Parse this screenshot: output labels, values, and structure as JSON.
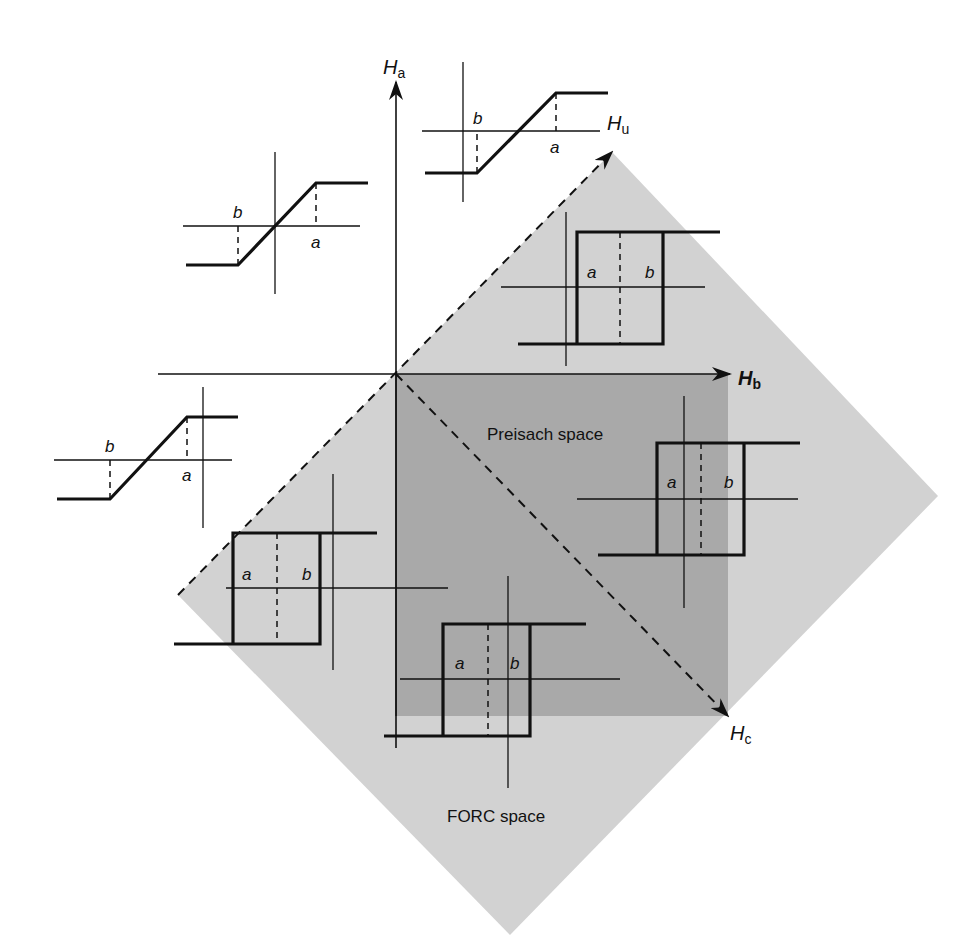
{
  "figure": {
    "width": 980,
    "height": 951,
    "colors": {
      "background": "#ffffff",
      "forc_region": "#d2d2d2",
      "preisach_region": "#a9a9a9",
      "line": "#111111"
    }
  },
  "axes": {
    "origin": [
      396,
      374
    ],
    "ha": {
      "label": "H",
      "subscript": "a",
      "from": [
        396,
        748
      ],
      "to": [
        396,
        82
      ],
      "label_pos": [
        383,
        74
      ]
    },
    "hb": {
      "label": "H",
      "subscript": "b",
      "from": [
        158,
        374
      ],
      "to": [
        730,
        374
      ],
      "label_pos": [
        738,
        385
      ]
    },
    "hu": {
      "label": "H",
      "subscript": "u",
      "from": [
        178,
        595
      ],
      "to": [
        612,
        152
      ],
      "label_pos": [
        607,
        130
      ]
    },
    "hc": {
      "label": "H",
      "subscript": "c",
      "from": [
        396,
        374
      ],
      "to": [
        728,
        716
      ],
      "label_pos": [
        730,
        740
      ]
    }
  },
  "regions": {
    "forc": {
      "label": "FORC space",
      "points": [
        [
          612,
          152
        ],
        [
          938,
          496
        ],
        [
          510,
          935
        ],
        [
          178,
          595
        ]
      ],
      "label_pos": [
        447,
        822
      ]
    },
    "preisach": {
      "label": "Preisach space",
      "rect": [
        396,
        374,
        332,
        342
      ],
      "label_pos": [
        487,
        440
      ]
    }
  },
  "hysterons": [
    {
      "id": "ramp-top",
      "type": "ramp",
      "vaxis_x": 463,
      "haxis_y": 131,
      "v_range": [
        62,
        202
      ],
      "h_range": [
        422,
        600
      ],
      "low_y": 173,
      "high_y": 93,
      "left_x": 425,
      "b_x": 477,
      "a_x": 556,
      "right_x": 608,
      "label_b": "b",
      "label_a": "a",
      "b_label_pos": [
        473,
        124
      ],
      "a_label_pos": [
        550,
        153
      ]
    },
    {
      "id": "ramp-upper-left",
      "type": "ramp",
      "vaxis_x": 275,
      "haxis_y": 226,
      "v_range": [
        152,
        294
      ],
      "h_range": [
        183,
        360
      ],
      "low_y": 265,
      "high_y": 183,
      "left_x": 186,
      "b_x": 238,
      "a_x": 316,
      "right_x": 368,
      "label_b": "b",
      "label_a": "a",
      "b_label_pos": [
        233,
        218
      ],
      "a_label_pos": [
        311,
        248
      ]
    },
    {
      "id": "ramp-left",
      "type": "ramp",
      "vaxis_x": 203,
      "haxis_y": 460,
      "v_range": [
        387,
        528
      ],
      "h_range": [
        54,
        232
      ],
      "low_y": 499,
      "high_y": 417,
      "left_x": 57,
      "b_x": 110,
      "a_x": 187,
      "right_x": 238,
      "label_b": "b",
      "label_a": "a",
      "b_label_pos": [
        105,
        452
      ],
      "a_label_pos": [
        182,
        481
      ]
    },
    {
      "id": "rect-upper-right",
      "type": "rect",
      "vaxis_x": 566,
      "haxis_y": 287,
      "v_range": [
        212,
        366
      ],
      "h_range": [
        501,
        705
      ],
      "low_y": 344,
      "high_y": 232,
      "left_x": 518,
      "a_x": 577,
      "b_x": 663,
      "right_x": 720,
      "mid_x": 620,
      "label_a": "a",
      "label_b": "b",
      "a_label_pos": [
        587,
        278
      ],
      "b_label_pos": [
        645,
        278
      ]
    },
    {
      "id": "rect-right",
      "type": "rect",
      "vaxis_x": 684,
      "haxis_y": 499,
      "v_range": [
        396,
        608
      ],
      "h_range": [
        577,
        798
      ],
      "low_y": 555,
      "high_y": 443,
      "left_x": 598,
      "a_x": 657,
      "b_x": 744,
      "right_x": 800,
      "mid_x": 701,
      "label_a": "a",
      "label_b": "b",
      "a_label_pos": [
        667,
        488
      ],
      "b_label_pos": [
        724,
        488
      ]
    },
    {
      "id": "rect-lower-left",
      "type": "rect",
      "vaxis_x": 333,
      "haxis_y": 588,
      "v_range": [
        474,
        670
      ],
      "h_range": [
        226,
        448
      ],
      "low_y": 644,
      "high_y": 533,
      "left_x": 174,
      "a_x": 233,
      "b_x": 320,
      "right_x": 377,
      "mid_x": 277,
      "label_a": "a",
      "label_b": "b",
      "a_label_pos": [
        242,
        580
      ],
      "b_label_pos": [
        302,
        580
      ],
      "extra_vline": {
        "x": 396,
        "from": 374,
        "to": 716
      }
    },
    {
      "id": "rect-bottom",
      "type": "rect",
      "vaxis_x": 508,
      "haxis_y": 679,
      "v_range": [
        576,
        788
      ],
      "h_range": [
        400,
        620
      ],
      "low_y": 736,
      "high_y": 624,
      "left_x": 384,
      "a_x": 443,
      "b_x": 530,
      "right_x": 586,
      "mid_x": 488,
      "label_a": "a",
      "label_b": "b",
      "a_label_pos": [
        455,
        669
      ],
      "b_label_pos": [
        510,
        669
      ]
    }
  ]
}
